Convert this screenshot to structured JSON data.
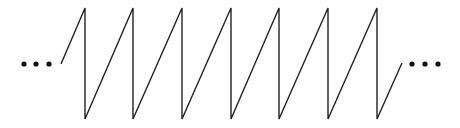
{
  "diagram": {
    "type": "sawtooth-wave",
    "stroke_color": "#222222",
    "dot_color": "#111111",
    "left_ellipsis": {
      "dots_x": [
        24,
        36,
        49
      ],
      "y": 64
    },
    "right_ellipsis": {
      "dots_x": [
        412,
        425,
        438
      ],
      "y": 64
    },
    "start_point": [
      61,
      64
    ],
    "teeth_x": [
      85,
      133,
      182,
      231,
      279,
      328,
      377
    ],
    "peak_y": 8,
    "trough_y": 119,
    "end_point": [
      402,
      63
    ]
  }
}
